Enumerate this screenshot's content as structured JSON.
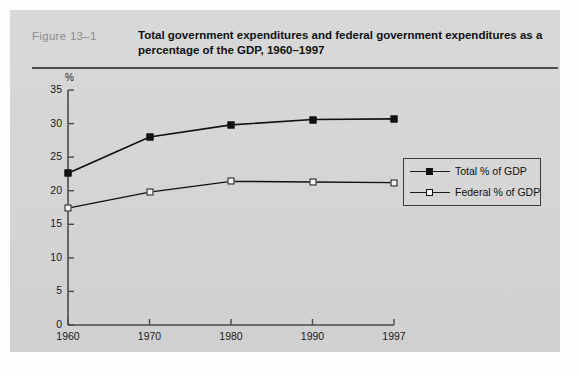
{
  "figure": {
    "label": "Figure  13–1",
    "title": "Total government expenditures and federal government expenditures as a percentage of the GDP, 1960–1997"
  },
  "legend": {
    "position": "inside-right",
    "entries": [
      {
        "label": "Total % of GDP",
        "marker": "filled-square"
      },
      {
        "label": "Federal % of GDP",
        "marker": "open-square"
      }
    ]
  },
  "axes": {
    "y_unit": "%",
    "y_ticks": [
      "35",
      "30",
      "25",
      "20",
      "15",
      "10",
      "5",
      "0"
    ],
    "x_ticks": [
      "1960",
      "1970",
      "1980",
      "1990",
      "1997"
    ]
  },
  "colors": {
    "panel_background": "#d6d6d6",
    "page_background": "#fdfdfd",
    "axis": "#4a4a4a",
    "series_total": "#111111",
    "series_federal": "#111111",
    "label_gray": "#8d8d8d",
    "text": "#111111"
  },
  "chart_data": {
    "type": "line",
    "title": "Total government expenditures and federal government expenditures as a percentage of the GDP, 1960–1997",
    "xlabel": "",
    "ylabel": "%",
    "categories": [
      "1960",
      "1970",
      "1980",
      "1990",
      "1997"
    ],
    "ylim": [
      0,
      35
    ],
    "ytick_step": 5,
    "grid": false,
    "legend": "inside-right",
    "series": [
      {
        "name": "Total % of GDP",
        "marker": "filled-square",
        "values": [
          22.6,
          28.0,
          29.8,
          30.6,
          30.7
        ]
      },
      {
        "name": "Federal % of GDP",
        "marker": "open-square",
        "values": [
          17.4,
          19.8,
          21.4,
          21.3,
          21.2
        ]
      }
    ]
  }
}
